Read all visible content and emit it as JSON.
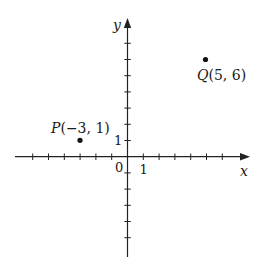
{
  "axes": {
    "x_label": "x",
    "y_label": "y",
    "origin_label": "0",
    "x_unit_label": "1",
    "y_unit_label": "1"
  },
  "points": [
    {
      "name": "P",
      "label": "P(−3, 1)",
      "x": -3,
      "y": 1
    },
    {
      "name": "Q",
      "label": "Q(5, 6)",
      "x": 5,
      "y": 6
    }
  ],
  "chart_data": {
    "type": "scatter",
    "title": "",
    "xlabel": "x",
    "ylabel": "y",
    "points": [
      {
        "label": "P(-3, 1)",
        "x": -3,
        "y": 1
      },
      {
        "label": "Q(5, 6)",
        "x": 5,
        "y": 6
      }
    ],
    "x_ticks": [
      -6,
      -5,
      -4,
      -3,
      -2,
      -1,
      1,
      2,
      3,
      4,
      5,
      6
    ],
    "y_ticks": [
      -5,
      -4,
      -3,
      -2,
      -1,
      1,
      2,
      3,
      4,
      5,
      6,
      7
    ],
    "xlim": [
      -7,
      7.5
    ],
    "ylim": [
      -6,
      8.5
    ],
    "grid": false
  }
}
